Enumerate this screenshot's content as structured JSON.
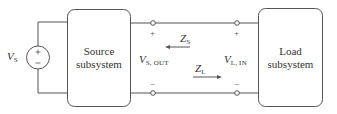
{
  "diagram": {
    "type": "circuit-block-diagram",
    "source_voltage": {
      "symbol": "V",
      "subscript": "S"
    },
    "source_box": {
      "line1": "Source",
      "line2": "subsystem"
    },
    "load_box": {
      "line1": "Load",
      "line2": "subsystem"
    },
    "output_voltage": {
      "symbol": "V",
      "subscript": "S, OUT"
    },
    "input_voltage": {
      "symbol": "V",
      "subscript": "L, IN"
    },
    "source_impedance": {
      "symbol": "Z",
      "subscript": "S",
      "arrow": "left"
    },
    "load_impedance": {
      "symbol": "Z",
      "subscript": "L",
      "arrow": "right"
    },
    "polarity": {
      "plus": "+",
      "minus": "−"
    },
    "colors": {
      "line": "#555555",
      "text": "#333333"
    }
  }
}
